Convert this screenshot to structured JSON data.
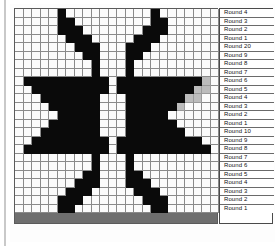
{
  "chart": {
    "type": "stitch-grid",
    "columns": 24,
    "rows": 24,
    "colors": {
      "filled": "#0a0a0a",
      "empty": "#fbfbfb",
      "accent": "#bcbcbc",
      "gridline": "#8a8a8a"
    },
    "legend_symbols": {
      "filled": "knit-stitch-dark",
      "empty": "knit-stitch-light",
      "accent": "knit-stitch-gray"
    },
    "grid": [
      "00000k0000000000k0000000",
      "00000kk000000000kk000000",
      "00000kkk0000000kkk000000",
      "000000kkk00000kkk0000000",
      "0000000kkk000kkk00000000",
      "00000000kk000kk000000000",
      "000000000k000k0000000000",
      "000000000k000k0000000000",
      "0kkkkkkkkkk0kkkkkkkkkkg0",
      "00kkkkkkkkk0kkkkkkkkkgg0",
      "000kkkkkkk000kkkkkkkgg00",
      "0000kkkkkk000kkkkkkg0000",
      "00000kkkkk000kkkkk000000",
      "0000kkkkkk000kkkkkk00000",
      "000kkkkkkk000kkkkkkk0000",
      "00kkkkkkkkk0kkkkkkkkkk00",
      "0kkkkkkkkkk0kkkkkkkkkkk0",
      "000000000k000k0000000000",
      "000000000k000k0000000000",
      "00000000kk000kk000000000",
      "0000000kkk000kkk00000000",
      "000000kkk00000kkk0000000",
      "00000kkk0000000kkk000000",
      "00000kk000000000kk000000"
    ]
  },
  "labels": {
    "prefix": "Round",
    "rows": [
      "Round 4",
      "Round 3",
      "Round 2",
      "Round 1",
      "Round 20",
      "Round 9",
      "Round 8",
      "Round 7",
      "Round 6",
      "Round 5",
      "Round 4",
      "Round 3",
      "Round 2",
      "Round 1",
      "Round 10",
      "Round 9",
      "Round 8",
      "Round 7",
      "Round 6",
      "Round 5",
      "Round 4",
      "Round 3",
      "Round 2",
      "Round 1"
    ]
  }
}
